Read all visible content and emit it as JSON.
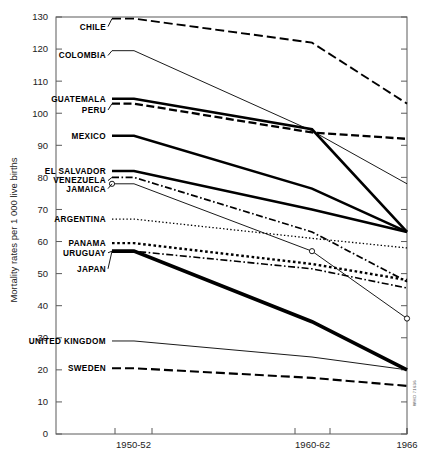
{
  "chart_data": {
    "type": "line",
    "title": "",
    "xlabel": "",
    "ylabel": "Mortality rates per 1 000 live births",
    "ylim": [
      0,
      130
    ],
    "ytick_labels": [
      "0",
      "10",
      "20",
      "30",
      "40",
      "50",
      "60",
      "70",
      "80",
      "90",
      "100",
      "110",
      "120",
      "130"
    ],
    "yticks": [
      0,
      10,
      20,
      30,
      40,
      50,
      60,
      70,
      80,
      90,
      100,
      110,
      120,
      130
    ],
    "x": [
      "1950-52",
      "1960-62",
      "1966"
    ],
    "xtick_labels": [
      "1950-52",
      "1960-62",
      "1966"
    ],
    "grid": false,
    "legend": "inline-labels-left",
    "credit": "WHO 71636",
    "series": [
      {
        "name": "CHILE",
        "label": "CHILE",
        "style": "dashed-long",
        "width": 1.9,
        "values": [
          129.5,
          122.0,
          103.0
        ],
        "label_y": 127.0,
        "marker": false
      },
      {
        "name": "COLOMBIA",
        "label": "COLOMBIA",
        "style": "solid-thin",
        "width": 0.9,
        "values": [
          119.5,
          94.5,
          78.0
        ],
        "label_y": 118.0,
        "marker": false
      },
      {
        "name": "GUATEMALA",
        "label": "GUATEMALA",
        "style": "solid-thick",
        "width": 2.6,
        "values": [
          104.5,
          95.0,
          63.0
        ],
        "label_y": 104.5,
        "marker": false
      },
      {
        "name": "PERU",
        "label": "PERU",
        "style": "dashed-medium",
        "width": 2.3,
        "values": [
          103.0,
          94.0,
          92.0
        ],
        "label_y": 101.0,
        "marker": false
      },
      {
        "name": "MEXICO",
        "label": "MEXICO",
        "style": "solid-thick",
        "width": 2.6,
        "values": [
          93.0,
          76.5,
          63.0
        ],
        "label_y": 93.0,
        "marker": false
      },
      {
        "name": "EL SALVADOR",
        "label": "EL SALVADOR",
        "style": "solid-thick",
        "width": 2.6,
        "values": [
          82.0,
          70.0,
          63.0
        ],
        "label_y": 82.0,
        "marker": false
      },
      {
        "name": "VENEZUELA",
        "label": "VENEZUELA",
        "style": "dash-dot",
        "width": 1.7,
        "values": [
          80.0,
          63.0,
          47.5
        ],
        "label_y": 79.0,
        "marker": false
      },
      {
        "name": "JAMAICA",
        "label": "JAMAICA",
        "style": "solid-thin",
        "width": 0.9,
        "values": [
          78.0,
          57.0,
          36.0
        ],
        "label_y": 76.5,
        "marker": true
      },
      {
        "name": "ARGENTINA",
        "label": "ARGENTINA",
        "style": "dotted-fine",
        "width": 1.3,
        "values": [
          67.0,
          61.0,
          58.0
        ],
        "label_y": 67.0,
        "marker": false
      },
      {
        "name": "PANAMA",
        "label": "PANAMA",
        "style": "dotted-bold",
        "width": 2.4,
        "values": [
          59.5,
          53.0,
          48.0
        ],
        "label_y": 59.5,
        "marker": false
      },
      {
        "name": "URUGUAY",
        "label": "URUGUAY",
        "style": "dash-dot",
        "width": 1.6,
        "values": [
          57.0,
          51.5,
          45.5
        ],
        "label_y": 56.5,
        "marker": false
      },
      {
        "name": "JAPAN",
        "label": "JAPAN",
        "style": "double-line",
        "width": 2.2,
        "values": [
          57.0,
          35.0,
          20.0
        ],
        "label_y": 51.5,
        "marker": false
      },
      {
        "name": "UNITED KINGDOM",
        "label": "UNITED KINGDOM",
        "style": "solid-thin",
        "width": 0.9,
        "values": [
          29.0,
          24.0,
          20.0
        ],
        "label_y": 29.0,
        "marker": false
      },
      {
        "name": "SWEDEN",
        "label": "SWEDEN",
        "style": "dashed-long",
        "width": 2.1,
        "values": [
          20.5,
          17.5,
          15.0
        ],
        "label_y": 20.5,
        "marker": false
      }
    ]
  }
}
